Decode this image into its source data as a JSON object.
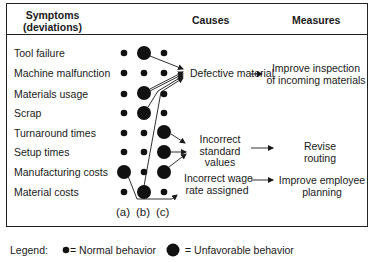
{
  "header": {
    "symptoms_line1": "Symptoms",
    "symptoms_line2": "(deviations)",
    "causes": "Causes",
    "measures": "Measures"
  },
  "symptoms": [
    {
      "label": "Tool failure",
      "dots": [
        "normal",
        "unfavorable",
        "normal"
      ]
    },
    {
      "label": "Machine malfunction",
      "dots": [
        "normal",
        "normal",
        "normal"
      ]
    },
    {
      "label": "Materials usage",
      "dots": [
        "normal",
        "unfavorable",
        "normal"
      ]
    },
    {
      "label": "Scrap",
      "dots": [
        "normal",
        "unfavorable",
        "normal"
      ]
    },
    {
      "label": "Turnaround times",
      "dots": [
        "normal",
        "normal",
        "unfavorable"
      ]
    },
    {
      "label": "Setup times",
      "dots": [
        "normal",
        "normal",
        "unfavorable"
      ]
    },
    {
      "label": "Manufacturing costs",
      "dots": [
        "unfavorable",
        "normal",
        "unfavorable"
      ]
    },
    {
      "label": "Material costs",
      "dots": [
        "normal",
        "unfavorable",
        "normal"
      ]
    }
  ],
  "columns": [
    "(a)",
    "(b)",
    "(c)"
  ],
  "causes": [
    {
      "line1": "Defective material",
      "line2": "",
      "line3": ""
    },
    {
      "line1": "Incorrect",
      "line2": "standard",
      "line3": "values"
    },
    {
      "line1": "Incorrect wage",
      "line2": "rate assigned",
      "line3": ""
    }
  ],
  "measures": [
    {
      "line1": "Improve inspection",
      "line2": "of incoming materials"
    },
    {
      "line1": "Revise",
      "line2": "routing"
    },
    {
      "line1": "Improve employee",
      "line2": "planning"
    }
  ],
  "legend": {
    "label": "Legend:",
    "normal": "= Normal behavior",
    "unfavorable": "= Unfavorable behavior"
  },
  "colors": {
    "ink": "#1a1a1a",
    "frame": "#222222",
    "background": "#ffffff"
  }
}
